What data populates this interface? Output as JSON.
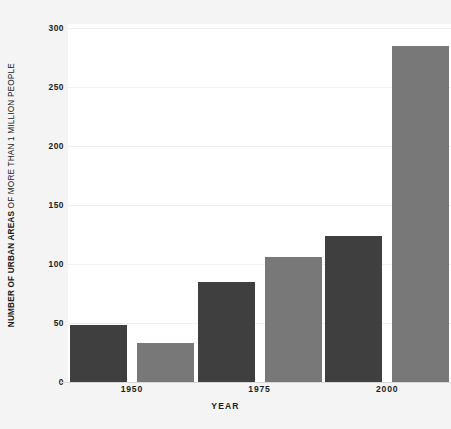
{
  "chart_data": {
    "type": "bar",
    "title": "",
    "subtitle": "",
    "xlabel": "YEAR",
    "ylabel_bold": "NUMBER OF URBAN AREAS",
    "ylabel_light": " OF MORE THAN 1 MILLION PEOPLE",
    "ylabel_full": "NUMBER OF URBAN AREAS OF MORE THAN 1 MILLION PEOPLE",
    "categories": [
      "1950",
      "1975",
      "2000"
    ],
    "series": [
      {
        "name": "dark-series",
        "color": "#3f3f3f",
        "values": [
          48,
          85,
          124
        ]
      },
      {
        "name": "light-series",
        "color": "#787878",
        "values": [
          33,
          106,
          285
        ]
      }
    ],
    "ylim": [
      0,
      300
    ],
    "ytick_labels": [
      "0",
      "50",
      "100",
      "150",
      "200",
      "250",
      "300"
    ],
    "ytick_values": [
      0,
      50,
      100,
      150,
      200,
      250,
      300
    ],
    "grid": true,
    "legend": "none",
    "plot_background": "#ffffff",
    "figure_background": "#f4f4f4",
    "text_color": "#1c1c1c"
  }
}
